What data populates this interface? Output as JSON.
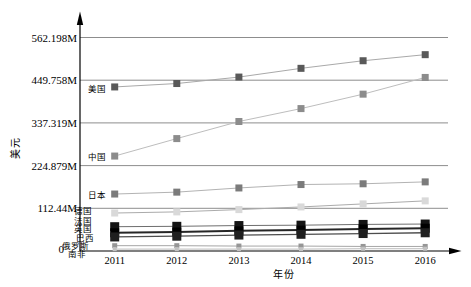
{
  "figure": {
    "title": "",
    "y_axis_title": "美元",
    "x_axis_title": "年份",
    "background_color": "#ffffff",
    "axis_color": "#000000",
    "gridline_color": "#808080"
  },
  "chart_data": {
    "type": "line",
    "title": "",
    "xlabel": "年份",
    "ylabel": "美元",
    "grid": true,
    "legend_position": "inline-left-of-first-point",
    "x": [
      2011,
      2012,
      2013,
      2014,
      2015,
      2016
    ],
    "x_tick_labels": [
      "2011",
      "2012",
      "2013",
      "2014",
      "2015",
      "2016"
    ],
    "y_tick_labels": [
      "562.198M",
      "449.758M",
      "337.319M",
      "224.879M",
      "112.44M",
      "0"
    ],
    "y_tick_values": [
      562.198,
      449.758,
      337.319,
      224.879,
      112.44,
      0
    ],
    "ylim": [
      0,
      590
    ],
    "unit": "M",
    "series": [
      {
        "name": "美国",
        "values": [
          432,
          441,
          458,
          481,
          501,
          517
        ],
        "marker_color": "#595959",
        "line_color": "#a9a9a9",
        "marker_size": 7,
        "line_width": 1
      },
      {
        "name": "中国",
        "values": [
          250,
          296,
          341,
          375,
          413,
          457
        ],
        "marker_color": "#8c8c8c",
        "line_color": "#bdbdbd",
        "marker_size": 7,
        "line_width": 1
      },
      {
        "name": "日本",
        "values": [
          150,
          155,
          166,
          175,
          177,
          182
        ],
        "marker_color": "#7b7b7b",
        "line_color": "#b3b3b3",
        "marker_size": 7,
        "line_width": 1
      },
      {
        "name": "德国",
        "values": [
          100,
          103,
          109,
          116,
          124,
          132
        ],
        "marker_color": "#d9d9d9",
        "line_color": "#ababab",
        "marker_size": 7,
        "line_width": 1
      },
      {
        "name": "法国",
        "values": [
          64,
          65,
          67,
          68,
          70,
          71
        ],
        "marker_color": "#141414",
        "line_color": "#6e6e6e",
        "marker_size": 9,
        "line_width": 1
      },
      {
        "name": "英国",
        "values": [
          48,
          50,
          53,
          55,
          58,
          60
        ],
        "marker_color": "#000000",
        "line_color": "#262626",
        "marker_size": 9,
        "line_width": 2
      },
      {
        "name": "巴西",
        "values": [
          37,
          39,
          42,
          44,
          46,
          48
        ],
        "marker_color": "#1f1f1f",
        "line_color": "#4d4d4d",
        "marker_size": 9,
        "line_width": 1.3
      },
      {
        "name": "俄罗斯",
        "values": [
          14,
          14,
          13,
          13,
          12,
          12
        ],
        "marker_color": "#969696",
        "line_color": "#a6a6a6",
        "marker_size": 5,
        "line_width": 1
      },
      {
        "name": "南非",
        "values": [
          5,
          5,
          5,
          5,
          6,
          6
        ],
        "marker_color": "#c2c2c2",
        "line_color": "#bdbdbd",
        "marker_size": 4,
        "line_width": 1
      }
    ]
  }
}
